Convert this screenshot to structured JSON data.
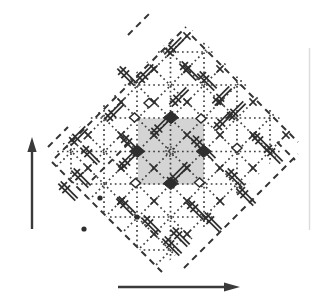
{
  "diagram": {
    "width": 313,
    "height": 304,
    "background": "#ffffff",
    "colors": {
      "ink": "#2e2e2e",
      "dots": "#3d3d3d",
      "dash": "#333333",
      "arrow": "#3a3a3a",
      "cell_fill": "#d4d4d4",
      "scan_artifact": "#dcdcdc"
    },
    "styles": {
      "dot_width": 1.7,
      "dot_dash": "1.7 3.1",
      "dash_width": 2,
      "dash_pattern": "6.5 5",
      "glyph_len": 24,
      "glyph_sep": 3.4,
      "glyph_width": 1.7,
      "tick_len": 11,
      "xmark_arm": 3.6
    },
    "lattice": {
      "origin_x": 170.5,
      "origin_y": 151.5,
      "spacing": 33,
      "clip_polygon": [
        [
          186,
          24
        ],
        [
          298,
          136
        ],
        [
          160,
          270
        ],
        [
          48,
          158
        ]
      ],
      "vertical_line_xs": [
        71,
        104,
        137,
        170.5,
        204,
        237,
        270
      ],
      "horizontal_line_ys": [
        52,
        85,
        118,
        151.5,
        184,
        217,
        250
      ],
      "diag_ne_c": [
        223,
        256,
        289,
        322,
        355,
        388,
        421
      ],
      "diag_se_d": [
        -80,
        -47,
        -14,
        19,
        52,
        85,
        118
      ]
    },
    "unit_cell": {
      "x": 138,
      "y": 118.5,
      "size": 66
    },
    "filled_diamonds": [
      [
        171,
        117.5
      ],
      [
        137.3,
        151.3
      ],
      [
        203.7,
        151.3
      ],
      [
        170.7,
        183.5
      ]
    ],
    "open_diamonds": [
      [
        134.5,
        117.5
      ],
      [
        201,
        118.5
      ],
      [
        135.5,
        183
      ],
      [
        199.5,
        182.5
      ],
      [
        237,
        148
      ],
      [
        149,
        103
      ]
    ],
    "open_circle": {
      "x": 170.5,
      "y": 151.5,
      "r": 4.5
    },
    "dark_dots": [
      [
        100,
        198
      ],
      [
        84,
        229
      ],
      [
        137,
        217
      ]
    ],
    "dislocation_glyphs": [
      {
        "x": 174,
        "y": 47,
        "dir": "ne"
      },
      {
        "x": 146,
        "y": 74,
        "dir": "ne"
      },
      {
        "x": 127,
        "y": 76,
        "dir": "se"
      },
      {
        "x": 189,
        "y": 71,
        "dir": "se"
      },
      {
        "x": 207,
        "y": 81,
        "dir": "se"
      },
      {
        "x": 179,
        "y": 97,
        "dir": "ne"
      },
      {
        "x": 222,
        "y": 96,
        "dir": "ne"
      },
      {
        "x": 236,
        "y": 111,
        "dir": "ne"
      },
      {
        "x": 223,
        "y": 121,
        "dir": "ne"
      },
      {
        "x": 114,
        "y": 112,
        "dir": "ne"
      },
      {
        "x": 163,
        "y": 124,
        "dir": "ne",
        "len": 32
      },
      {
        "x": 78,
        "y": 136,
        "dir": "ne"
      },
      {
        "x": 130,
        "y": 144,
        "dir": "se"
      },
      {
        "x": 90,
        "y": 155,
        "dir": "se"
      },
      {
        "x": 128,
        "y": 160,
        "dir": "ne"
      },
      {
        "x": 203,
        "y": 148,
        "dir": "se",
        "len": 32
      },
      {
        "x": 261,
        "y": 142,
        "dir": "se"
      },
      {
        "x": 273,
        "y": 154,
        "dir": "se"
      },
      {
        "x": 178,
        "y": 174,
        "dir": "ne",
        "len": 30
      },
      {
        "x": 81,
        "y": 178,
        "dir": "se"
      },
      {
        "x": 68,
        "y": 191,
        "dir": "se"
      },
      {
        "x": 235,
        "y": 178,
        "dir": "se"
      },
      {
        "x": 246,
        "y": 196,
        "dir": "se"
      },
      {
        "x": 126,
        "y": 206,
        "dir": "se"
      },
      {
        "x": 196,
        "y": 210,
        "dir": "se"
      },
      {
        "x": 212,
        "y": 222,
        "dir": "se"
      },
      {
        "x": 151,
        "y": 225,
        "dir": "se"
      },
      {
        "x": 180,
        "y": 237,
        "dir": "se"
      },
      {
        "x": 172,
        "y": 246,
        "dir": "se"
      }
    ],
    "dashed_segments": [
      {
        "x1": 55,
        "y1": 158,
        "x2": 186,
        "y2": 27
      },
      {
        "x1": 192,
        "y1": 36,
        "x2": 298,
        "y2": 142
      },
      {
        "x1": 184,
        "y1": 268,
        "x2": 298,
        "y2": 154
      },
      {
        "x1": 52,
        "y1": 162,
        "x2": 162,
        "y2": 272
      },
      {
        "x1": 128,
        "y1": 35,
        "x2": 151,
        "y2": 12
      },
      {
        "x1": 92,
        "y1": 180,
        "x2": 130,
        "y2": 142
      },
      {
        "x1": 277,
        "y1": 142,
        "x2": 295,
        "y2": 160
      },
      {
        "x1": 48,
        "y1": 147,
        "x2": 68,
        "y2": 127
      }
    ],
    "scan_artifact_line": {
      "x": 309.5,
      "y1": 48,
      "y2": 230
    },
    "arrows": {
      "color": "#3a3a3a",
      "width": 2.4,
      "vertical": {
        "x": 32,
        "y1": 229,
        "y2": 150,
        "tip_y": 137,
        "half_head": 4.6
      },
      "horizontal": {
        "y": 287,
        "x1": 118,
        "x2": 226,
        "tip_x": 240,
        "half_head": 4.6
      }
    }
  }
}
